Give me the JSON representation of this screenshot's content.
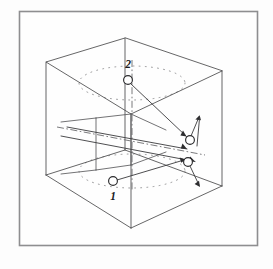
{
  "figure": {
    "background_color": "#fdfdfd",
    "frame": {
      "name": "outer-border-frame",
      "x": 19,
      "y": 11,
      "width": 239,
      "height": 235,
      "stroke_color": "#8e8e90"
    },
    "cube": {
      "name": "isometric-cube",
      "stroke_color": "#4a4a4c",
      "vertices": {
        "top_back": [
          125,
          38
        ],
        "top_left": [
          46,
          62
        ],
        "top_right": [
          222,
          71
        ],
        "top_front": [
          131,
          114
        ],
        "bot_left": [
          46,
          175
        ],
        "bot_right": [
          222,
          186
        ],
        "bot_front": [
          131,
          228
        ],
        "bot_back": [
          125,
          150
        ]
      }
    },
    "inner_plane": {
      "name": "interior-vertical-plane",
      "corners": [
        [
          96,
          118
        ],
        [
          131,
          114
        ],
        [
          131,
          165
        ],
        [
          96,
          170
        ]
      ]
    },
    "axis": {
      "name": "vertical-spin-axis",
      "x1": 132,
      "y1": 62,
      "x2": 132,
      "y2": 186,
      "style": "dash-dot"
    },
    "horizontal_axis": {
      "name": "horizontal-reference-axis",
      "x1": 57,
      "y1": 128,
      "x2": 200,
      "y2": 153,
      "style": "dash-dot"
    },
    "orbits": [
      {
        "name": "upper-orbit-ellipse",
        "cx": 132,
        "cy": 83,
        "rx": 53,
        "ry": 17,
        "style": "dotted"
      },
      {
        "name": "lower-orbit-ellipse",
        "cx": 132,
        "cy": 171,
        "rx": 53,
        "ry": 17,
        "style": "dotted"
      }
    ],
    "nodes": [
      {
        "id": "node-2",
        "label": "2",
        "cx": 128,
        "cy": 80,
        "r": 4.4,
        "label_x": 128,
        "label_y": 65
      },
      {
        "id": "node-1",
        "label": "1",
        "cx": 113,
        "cy": 181,
        "r": 4.4,
        "label_x": 113,
        "label_y": 196
      },
      {
        "id": "node-2-target",
        "label": "",
        "cx": 190,
        "cy": 140,
        "r": 4.4,
        "label_x": 0,
        "label_y": 0
      },
      {
        "id": "node-1-target",
        "label": "",
        "cx": 188,
        "cy": 162,
        "r": 4.4,
        "label_x": 0,
        "label_y": 0
      }
    ],
    "vectors": [
      {
        "name": "vector-2-to-target",
        "from": [
          131,
          84
        ],
        "to": [
          187,
          137
        ],
        "arrow": true
      },
      {
        "name": "vector-2-tangent",
        "from": [
          191,
          136
        ],
        "to": [
          198,
          118
        ],
        "arrow": true
      },
      {
        "name": "vector-2-tangent-return",
        "from": [
          198,
          120
        ],
        "to": [
          196,
          145
        ],
        "arrow": false
      },
      {
        "name": "vector-1-to-target",
        "from": [
          117,
          180
        ],
        "to": [
          184,
          160
        ],
        "arrow": true
      },
      {
        "name": "vector-1-tangent",
        "from": [
          189,
          166
        ],
        "to": [
          199,
          184
        ],
        "arrow": true
      },
      {
        "name": "vector-long-chord",
        "from": [
          61,
          136
        ],
        "to": [
          196,
          162
        ],
        "arrow": true
      },
      {
        "name": "vector-upper-chord",
        "from": [
          67,
          128
        ],
        "to": [
          188,
          150
        ],
        "arrow": true
      }
    ],
    "labels": {
      "node_one": "1",
      "node_two": "2"
    }
  }
}
